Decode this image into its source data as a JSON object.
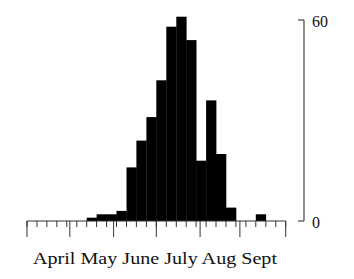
{
  "chart_data": {
    "type": "bar",
    "title": "",
    "xlabel": "",
    "ylabel": "",
    "ylim": [
      0,
      60
    ],
    "y_ticks": [
      0,
      60
    ],
    "y_tick_labels": [
      "0",
      "60"
    ],
    "y_axis_position": "right",
    "grid": false,
    "legend": null,
    "x_month_labels": [
      "April",
      "May",
      "June",
      "July",
      "Aug",
      "Sept"
    ],
    "bin_width_note": "approximately weekly bins (4 per month)",
    "bin_start_index": 6,
    "values": [
      1,
      2,
      2,
      3,
      16,
      24,
      31,
      42,
      58,
      61,
      54,
      18,
      36,
      20,
      4,
      0,
      0,
      2
    ],
    "bar_color": "#000000"
  },
  "axis": {
    "y_top_label": "60",
    "y_bottom_label": "0",
    "x_labels_text": "April May June July Aug Sept"
  }
}
